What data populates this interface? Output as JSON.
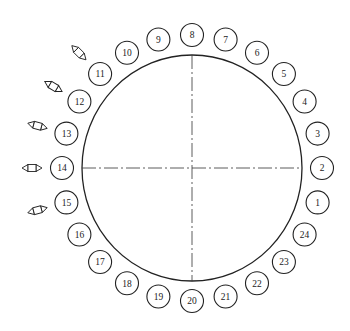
{
  "diagram": {
    "title": "",
    "positions": [
      {
        "label": "1"
      },
      {
        "label": "2"
      },
      {
        "label": "3"
      },
      {
        "label": "4"
      },
      {
        "label": "5"
      },
      {
        "label": "6"
      },
      {
        "label": "7"
      },
      {
        "label": "8"
      },
      {
        "label": "9"
      },
      {
        "label": "10"
      },
      {
        "label": "11"
      },
      {
        "label": "12"
      },
      {
        "label": "13"
      },
      {
        "label": "14"
      },
      {
        "label": "15"
      },
      {
        "label": "16"
      },
      {
        "label": "17"
      },
      {
        "label": "18"
      },
      {
        "label": "19"
      },
      {
        "label": "20"
      },
      {
        "label": "21"
      },
      {
        "label": "22"
      },
      {
        "label": "23"
      },
      {
        "label": "24"
      }
    ],
    "marked_positions": [
      "11",
      "12",
      "13",
      "14",
      "15"
    ],
    "total_positions": 24,
    "colors": {
      "line": "#222222",
      "background": "#ffffff"
    }
  }
}
